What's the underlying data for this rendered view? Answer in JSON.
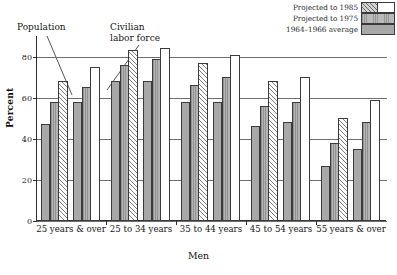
{
  "chart_data": {
    "type": "bar",
    "title": "",
    "xlabel": "Men",
    "ylabel": "Percent",
    "ylim": [
      0,
      90
    ],
    "yticks": [
      0,
      20,
      40,
      60,
      80
    ],
    "ytick_labels": [
      "0",
      "20",
      "40",
      "60",
      "80"
    ],
    "grid": true,
    "legend_position": "top-right",
    "categories": [
      "25 years & over",
      "25 to 34 years",
      "35 to 44 years",
      "45 to 54 years",
      "55 years & over"
    ],
    "cluster_labels": [
      "Population",
      "Civilian labor force"
    ],
    "series": [
      {
        "name": "1964–1966 average",
        "pattern": "solid-gray",
        "population_values": [
          47,
          68,
          58,
          46,
          27
        ],
        "labor_force_values": [
          58,
          68,
          58,
          48,
          35
        ]
      },
      {
        "name": "Projected to 1975",
        "pattern": "vertical-hatch",
        "population_values": [
          58,
          76,
          66,
          56,
          38
        ],
        "labor_force_values": [
          65,
          79,
          70,
          58,
          48
        ]
      },
      {
        "name": "Projected to 1985",
        "pattern": "diagonal-hatch-and-white",
        "population_values": [
          68,
          83,
          77,
          68,
          50
        ],
        "labor_force_values": [
          75,
          84,
          81,
          70,
          59
        ]
      }
    ],
    "annotations": [
      {
        "text": "Population",
        "target": "first cluster of each age group"
      },
      {
        "text": "Civilian",
        "text2": "labor force",
        "target": "second cluster of each age group"
      }
    ]
  },
  "legend": {
    "items": [
      {
        "label": "Projected to 1985",
        "swatch": "diagonal-hatch-and-white"
      },
      {
        "label": "Projected to 1975",
        "swatch": "vertical-hatch"
      },
      {
        "label": "1964–1966 average",
        "swatch": "solid-gray"
      }
    ]
  },
  "annotations": {
    "population": "Population",
    "civilian_line1": "Civilian",
    "civilian_line2": "labor force"
  },
  "axes": {
    "y_title": "Percent",
    "x_title": "Men"
  }
}
